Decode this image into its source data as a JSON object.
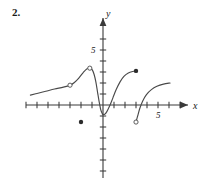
{
  "problem": {
    "number": "2."
  },
  "chart_data": {
    "type": "line",
    "title": "",
    "xlabel": "x",
    "ylabel": "y",
    "grid": false,
    "legend": null,
    "xlim": [
      -7.5,
      8.5
    ],
    "ylim": [
      -7.5,
      7.0
    ],
    "x_tick_labels": [
      {
        "value": 5,
        "text": "5"
      }
    ],
    "y_tick_labels": [
      {
        "value": 5,
        "text": "5"
      }
    ],
    "x_ticks": [
      -7,
      -6,
      -5,
      -4,
      -3,
      -2,
      -1,
      1,
      2,
      3,
      4,
      5,
      6,
      7
    ],
    "y_ticks": [
      -6,
      -5,
      -4,
      -3,
      -2,
      -1,
      1,
      2,
      3,
      4,
      5,
      6
    ],
    "series": [
      {
        "name": "branch-left",
        "comment": "rises slowly from far left to a local maximum, then falls steeply to the origin dip",
        "points": [
          [
            -6.6,
            0.9
          ],
          [
            -6.0,
            1.05
          ],
          [
            -5.2,
            1.25
          ],
          [
            -4.4,
            1.45
          ],
          [
            -3.6,
            1.62
          ],
          [
            -3.0,
            1.8
          ],
          [
            -2.6,
            2.05
          ],
          [
            -2.2,
            2.45
          ],
          [
            -1.8,
            2.95
          ],
          [
            -1.45,
            3.3
          ],
          [
            -1.15,
            3.35
          ],
          [
            -0.95,
            3.15
          ],
          [
            -0.8,
            2.75
          ],
          [
            -0.65,
            2.1
          ],
          [
            -0.5,
            1.2
          ],
          [
            -0.35,
            0.3
          ],
          [
            -0.2,
            -0.45
          ],
          [
            -0.05,
            -0.82
          ]
        ]
      },
      {
        "name": "branch-middle",
        "comment": "rises from the dip near the origin up to the solid endpoint",
        "points": [
          [
            -0.05,
            -0.82
          ],
          [
            0.15,
            -0.85
          ],
          [
            0.35,
            -0.6
          ],
          [
            0.6,
            -0.1
          ],
          [
            0.9,
            0.65
          ],
          [
            1.2,
            1.4
          ],
          [
            1.55,
            2.1
          ],
          [
            1.9,
            2.6
          ],
          [
            2.3,
            2.9
          ],
          [
            2.7,
            3.05
          ],
          [
            3.0,
            3.1
          ]
        ]
      },
      {
        "name": "branch-right",
        "comment": "rises from the open endpoint below the axis up and to the right",
        "points": [
          [
            3.0,
            -1.55
          ],
          [
            3.15,
            -1.0
          ],
          [
            3.35,
            -0.3
          ],
          [
            3.6,
            0.35
          ],
          [
            3.95,
            0.95
          ],
          [
            4.4,
            1.4
          ],
          [
            4.9,
            1.7
          ],
          [
            5.5,
            1.9
          ],
          [
            6.1,
            2.0
          ]
        ]
      }
    ],
    "open_points": [
      {
        "x": -3.0,
        "y": 1.8,
        "label": "open-circle-left-mid"
      },
      {
        "x": -1.2,
        "y": 3.35,
        "label": "open-circle-peak"
      },
      {
        "x": 3.0,
        "y": -1.55,
        "label": "open-circle-right-lower"
      }
    ],
    "closed_points": [
      {
        "x": -2.0,
        "y": -1.55,
        "label": "solid-dot-isolated"
      },
      {
        "x": 3.0,
        "y": 3.1,
        "label": "solid-dot-endpoint"
      }
    ],
    "colors": {
      "curve": "#4a4a4a",
      "axis": "#3a3a3a",
      "text": "#1a1a1a",
      "background": "#ffffff"
    }
  }
}
